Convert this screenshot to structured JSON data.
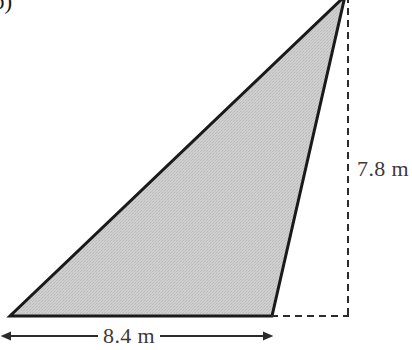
{
  "figure": {
    "part_label": "b)",
    "shape": "triangle",
    "fill_color": "#c9c9c9",
    "outline_color": "#1a1a1a",
    "dashed_color": "#2b2b2b",
    "background_color": "#ffffff",
    "text_color": "#3a3a3a",
    "vertices": [
      {
        "name": "bottom-left",
        "x": 10,
        "y": 316
      },
      {
        "name": "bottom-right",
        "x": 272,
        "y": 316
      },
      {
        "name": "apex",
        "x": 345,
        "y": -4
      }
    ]
  },
  "dimensions": {
    "height": {
      "label": "7.8 m",
      "value": 7.8,
      "unit": "m",
      "orientation": "vertical",
      "line_style": "dashed"
    },
    "base": {
      "label": "8.4 m",
      "value": 8.4,
      "unit": "m",
      "orientation": "horizontal",
      "line_style": "double-arrow"
    }
  }
}
